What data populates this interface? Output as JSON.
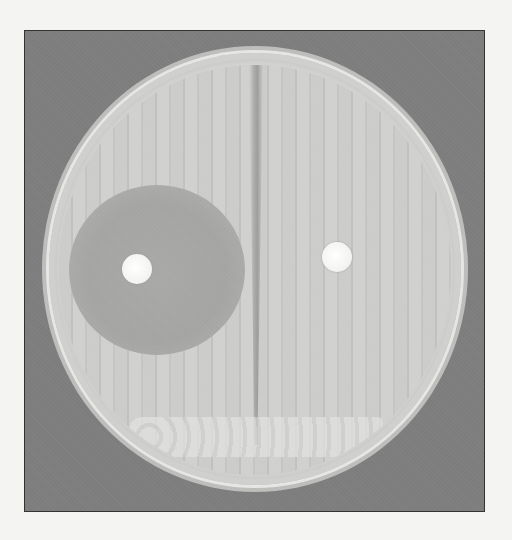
{
  "image": {
    "subject": "petri-dish-disk-diffusion-assay",
    "colors": {
      "page_background": "#f4f4f2",
      "frame_background": "#7d7d7d",
      "agar": "#c6c6c4",
      "inhibition_zone": "#a6a6a4",
      "disk": "#f8f8f6"
    },
    "elements": {
      "left_disk": {
        "label": "antibiotic-disk",
        "has_inhibition_zone": true
      },
      "right_disk": {
        "label": "antibiotic-disk",
        "has_inhibition_zone": false
      }
    }
  }
}
